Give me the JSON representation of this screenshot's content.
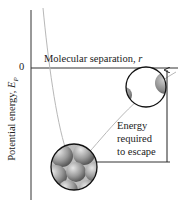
{
  "figure": {
    "y_axis_label": "Potential energy, ",
    "y_axis_symbol": "E",
    "y_axis_subscript": "P",
    "zero_label": "0",
    "x_axis_label": "Molecular separation, ",
    "x_axis_symbol": "r",
    "annotation_lines": [
      "Energy",
      "required",
      "to escape"
    ]
  },
  "colors": {
    "axis": "#333333",
    "curve": "#b8b8b8",
    "circle_outline": "#111111",
    "sphere_dark": "#6f6f6f",
    "sphere_light": "#d8d8d8"
  },
  "icons": {
    "arrow": "up-arrow",
    "bound_molecules": "packed-spheres-circle",
    "separated_molecules": "separated-spheres-circle"
  }
}
